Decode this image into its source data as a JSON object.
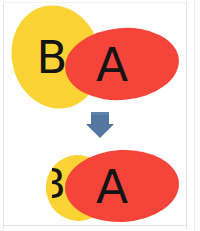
{
  "diagram": {
    "background_color": "#ffffff",
    "frame_color": "#e3e3e3",
    "operator": {
      "icon": "down-arrow-icon",
      "label": "",
      "color": "#53779f",
      "direction": "down"
    },
    "before": {
      "caption": "",
      "shapes": [
        {
          "id": "shape-b",
          "label": "B",
          "fill": "#fbd334",
          "label_color": "#141414",
          "role": "back-shape",
          "geometry": {
            "cx": 56,
            "cy": 57,
            "rx": 44,
            "ry": 52,
            "rotate": -14
          },
          "label_pos": {
            "x": 52,
            "y": 72,
            "size": 44
          }
        },
        {
          "id": "shape-a",
          "label": "A",
          "fill": "#f5453b",
          "label_color": "#141414",
          "role": "front-shape",
          "geometry": {
            "cx": 122,
            "cy": 64,
            "rx": 57,
            "ry": 36,
            "rotate": -5
          },
          "label_pos": {
            "x": 108,
            "y": 80,
            "size": 46
          }
        }
      ]
    },
    "after": {
      "caption": "",
      "shapes": [
        {
          "id": "shape-b-result",
          "label": "B",
          "fill": "#fbd334",
          "label_color": "#141414",
          "role": "clipped-back-shape",
          "geometry": {
            "cx": 75,
            "cy": 188,
            "rx": 28,
            "ry": 31,
            "rotate": -14
          },
          "label_pos": {
            "x": 50,
            "y": 198,
            "size": 40
          }
        },
        {
          "id": "shape-a-result",
          "label": "A",
          "fill": "#f5453b",
          "label_color": "#141414",
          "role": "front-shape",
          "geometry": {
            "cx": 122,
            "cy": 186,
            "rx": 57,
            "ry": 36,
            "rotate": -3
          },
          "label_pos": {
            "x": 101,
            "y": 202,
            "size": 46
          }
        }
      ]
    },
    "colors": {
      "yellow": "#fbd334",
      "red": "#f5453b",
      "ink": "#141414",
      "arrow": "#53779f",
      "arrow_dark": "#3f5f85"
    }
  }
}
